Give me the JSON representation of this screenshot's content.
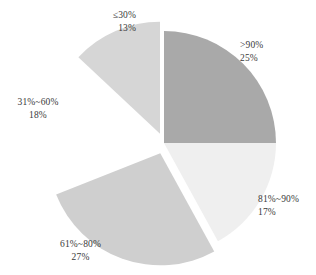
{
  "chart_data": {
    "type": "pie",
    "title": "",
    "title_fragment_visible": "",
    "xlabel": "",
    "ylabel": "",
    "legend_position": "none",
    "grid": false,
    "labels_show_name_and_percent": true,
    "start_angle_deg": 0,
    "direction": "clockwise",
    "categories": [
      ">90%",
      "81%~90%",
      "61%~80%",
      "31%~60%",
      "≤30%"
    ],
    "values": [
      25,
      17,
      27,
      18,
      13
    ],
    "value_suffix": "%",
    "slices": [
      {
        "name": ">90%",
        "value": 25,
        "value_label": "25%",
        "color": "#a9a9a9",
        "start_deg": 0,
        "end_deg": 90,
        "exploded": false,
        "explode_offset": 0,
        "rendered": true
      },
      {
        "name": "81%~90%",
        "value": 17,
        "value_label": "17%",
        "color": "#efefef",
        "start_deg": 90,
        "end_deg": 151.2,
        "exploded": false,
        "explode_offset": 0,
        "rendered": true
      },
      {
        "name": "61%~80%",
        "value": 27,
        "value_label": "27%",
        "color": "#cfcfcf",
        "start_deg": 151.2,
        "end_deg": 248.4,
        "exploded": true,
        "explode_offset": 11,
        "rendered": true
      },
      {
        "name": "31%~60%",
        "value": 18,
        "value_label": "18%",
        "color": "#ffffff",
        "start_deg": 248.4,
        "end_deg": 313.2,
        "exploded": true,
        "explode_offset": 14,
        "rendered": false
      },
      {
        "name": "≤30%",
        "value": 13,
        "value_label": "13%",
        "color": "#d6d6d6",
        "start_deg": 313.2,
        "end_deg": 360,
        "exploded": true,
        "explode_offset": 10,
        "rendered": true
      }
    ],
    "geometry": {
      "center_x": 164,
      "center_y": 143,
      "radius": 112
    },
    "colors": {
      "gt90": "#a9a9a9",
      "p81_90": "#efefef",
      "p61_80": "#cfcfcf",
      "p31_60": "#ffffff",
      "le30": "#d6d6d6",
      "text": "#3a3a3a",
      "background": "#ffffff"
    }
  }
}
